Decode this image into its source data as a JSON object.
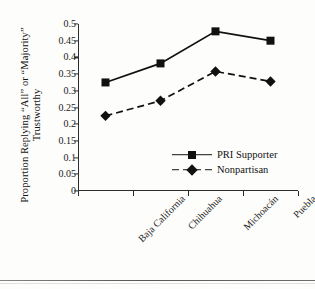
{
  "chart_data": {
    "type": "line",
    "title": "",
    "xlabel": "",
    "ylabel_line1": "Proportion Replying “All” or “Majority”",
    "ylabel_line2": "Trustworthy",
    "categories": [
      "Baja California",
      "Chihuahua",
      "Michoacán",
      "Puebla"
    ],
    "series": [
      {
        "name": "PRI Supporter",
        "values": [
          0.325,
          0.382,
          0.478,
          0.45
        ],
        "line_style": "solid",
        "marker": "square",
        "color": "#111111"
      },
      {
        "name": "Nonpartisan",
        "values": [
          0.225,
          0.27,
          0.358,
          0.328
        ],
        "line_style": "dashed",
        "marker": "diamond",
        "color": "#111111"
      }
    ],
    "ylim": [
      0,
      0.5
    ],
    "ytick_values": [
      0.5,
      0.45,
      0.4,
      0.35,
      0.3,
      0.25,
      0.2,
      0.15,
      0.1,
      0.05,
      0
    ],
    "ytick_labels": [
      "0.5",
      "0.45",
      "0.4",
      "0.35",
      "0.3",
      "0.25",
      "0.2",
      "0.15",
      "0.1",
      "0.05",
      "0"
    ],
    "grid": false,
    "legend_position": "inside-lower-right"
  },
  "legend": {
    "entries": [
      {
        "label": "PRI Supporter"
      },
      {
        "label": "Nonpartisan"
      }
    ]
  }
}
